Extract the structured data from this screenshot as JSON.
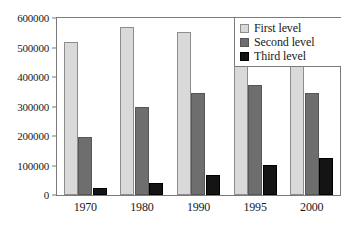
{
  "chart_data": {
    "type": "bar",
    "title": "",
    "subtitle": "",
    "xlabel": "",
    "ylabel": "",
    "categories": [
      "1970",
      "1980",
      "1990",
      "1995",
      "2000"
    ],
    "series": [
      {
        "name": "First level",
        "color": "#d9d9d9",
        "values": [
          520000,
          568000,
          554000,
          485000,
          441000
        ]
      },
      {
        "name": "Second level",
        "color": "#6e6e6e",
        "values": [
          196000,
          300000,
          346000,
          373000,
          347000
        ]
      },
      {
        "name": "Third level",
        "color": "#141414",
        "values": [
          24000,
          41000,
          68000,
          101000,
          126000
        ]
      }
    ],
    "ylim": [
      0,
      600000
    ],
    "yticks": [
      0,
      100000,
      200000,
      300000,
      400000,
      500000,
      600000
    ],
    "ytick_labels": [
      "0",
      "100000",
      "200000",
      "300000",
      "400000",
      "500000",
      "600000"
    ],
    "grid": false,
    "legend_position": "top-right"
  }
}
